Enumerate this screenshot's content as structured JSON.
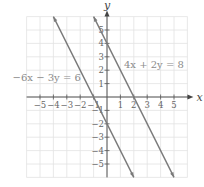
{
  "chart_data": {
    "type": "line",
    "title": "",
    "xlabel": "x",
    "ylabel": "y",
    "xlim": [
      -6,
      6
    ],
    "ylim": [
      -6,
      6
    ],
    "grid": true,
    "x_ticks": [
      -5,
      -4,
      -3,
      -2,
      -1,
      1,
      2,
      3,
      4,
      5
    ],
    "y_ticks": [
      -5,
      -4,
      -3,
      -2,
      -1,
      1,
      2,
      3,
      4,
      5
    ],
    "x_tick_labels": [
      "−5",
      "−4",
      "−3",
      "−2",
      "−1",
      "1",
      "2",
      "3",
      "4",
      "5"
    ],
    "y_tick_labels": [
      "−5",
      "−4",
      "−3",
      "−2",
      "−1",
      "1",
      "2",
      "3",
      "4",
      "5"
    ],
    "series": [
      {
        "name": "4x + 2y = 8",
        "equation": "y = -2x + 4",
        "slope": -2,
        "intercept": 4,
        "x": [
          -1,
          5
        ],
        "y": [
          6,
          -6
        ],
        "x_intercept": 2,
        "y_intercept": 4,
        "color": "#7a7a7a"
      },
      {
        "name": "−6x − 3y = 6",
        "equation": "y = -2x - 2",
        "slope": -2,
        "intercept": -2,
        "x": [
          -4,
          2
        ],
        "y": [
          6,
          -6
        ],
        "x_intercept": -1,
        "y_intercept": -2,
        "color": "#7a7a7a"
      }
    ],
    "annotations": [
      {
        "text": "4x + 2y = 8",
        "x": 3.5,
        "y": 2.2
      },
      {
        "text": "−6x − 3y = 6",
        "x": -4.5,
        "y": 1.2
      }
    ]
  }
}
